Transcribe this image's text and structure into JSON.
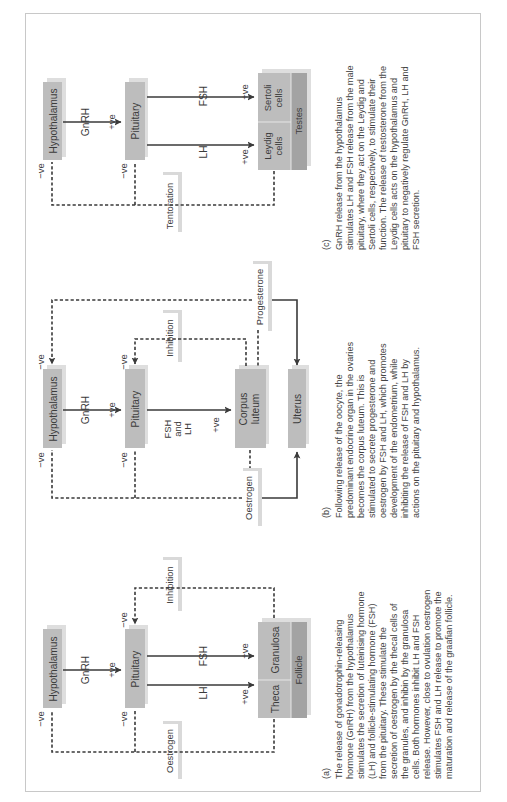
{
  "orientation": "rotated -90deg (landscape figure shown portrait)",
  "colors": {
    "box_fill": "#bdbdbd",
    "box_dark_fill": "#a3a3a3",
    "shadow": "#dedede",
    "line": "#3a3a3a",
    "text": "#3b3b3b",
    "frame_border": "#c8c8c8"
  },
  "panels": {
    "a": {
      "label": "(a)",
      "nodes": {
        "hypothalamus": "Hypothalamus",
        "pituitary": "Pituitary",
        "granulosa": "Granulosa",
        "theca": "Theca",
        "follicle": "Follicle",
        "inhibition": "Inhibition",
        "oestrogen": "Oestrogen"
      },
      "edges": {
        "gnrh": "GnRH",
        "gnrh_sign": "+ve",
        "fsh": "FSH",
        "fsh_sign": "+ve",
        "lh": "LH",
        "lh_sign": "+ve",
        "neg_hypo": "−ve",
        "neg_pit_bottom": "−ve",
        "neg_pit_top": "−ve"
      },
      "caption_lines": [
        "The release of gonadotrophin-releasing",
        "hormone (GnRH) from the hypothalamus",
        "stimulates the secretion of luteinising hormone",
        "(LH) and follicle-stimulating hormone (FSH)",
        "from the pituitary. These stimulate the",
        "secretion of oestrogen by the thecal cells of",
        "the granules, and inhibin by the granulosa",
        "cells. Both hormones inhibit LH and FSH",
        "release. However, close to ovulation oestrogen",
        "stimulates FSH and LH release to promote the",
        "maturation and release of the graafian follicle."
      ]
    },
    "b": {
      "label": "(b)",
      "nodes": {
        "hypothalamus": "Hypothalamus",
        "pituitary": "Pituitary",
        "corpus_line1": "Corpus",
        "corpus_line2": "luteum",
        "uterus": "Uterus",
        "inhibition": "Inhibition",
        "progesterone": "Progesterone",
        "oestrogen": "Oestrogen"
      },
      "edges": {
        "gnrh": "GnRH",
        "gnrh_sign": "+ve",
        "fshlh_line1": "FSH",
        "fshlh_line2": "and",
        "fshlh_line3": "LH",
        "fshlh_sign": "+ve",
        "neg_hypo_bottom": "−ve",
        "neg_hypo_top": "−ve",
        "neg_pit_bottom": "−ve",
        "neg_pit_top": "−ve"
      },
      "caption_lines": [
        "Following release of the oocyte, the",
        "predominant endocrine organ in the ovaries",
        "becomes the corpus luteum. This is",
        "stimulated to secrete progesterone and",
        "oestrogen by FSH and LH, which promotes",
        "development of the endometrium, while",
        "inhibiting the release of FSH and LH by",
        "actions on the pituitary and hypothalamus."
      ]
    },
    "c": {
      "label": "(c)",
      "nodes": {
        "hypothalamus": "Hypothalamus",
        "pituitary": "Pituitary",
        "leydig_line1": "Leydig",
        "leydig_line2": "cells",
        "sertoli_line1": "Sertoli",
        "sertoli_line2": "cells",
        "testes": "Testes",
        "tentoration": "Tentoration"
      },
      "edges": {
        "gnrh": "GnRH",
        "gnrh_sign": "+ve",
        "fsh": "FSH",
        "fsh_sign": "+ve",
        "lh": "LH",
        "lh_sign": "+ve",
        "neg_hypo": "−ve",
        "neg_pit": "−ve"
      },
      "caption_lines": [
        "GnRH release from the hypothalamus",
        "stimulates LH and FSH release from the male",
        "pituitary, where they act on the Leydig and",
        "Sertoli cells, respectively, to stimulate their",
        "function. The release of testosterone from the",
        "Leydig cells acts on the hypothalamus and",
        "pituitary to negatively regulate GnRH, LH and",
        "FSH secretion."
      ]
    }
  }
}
